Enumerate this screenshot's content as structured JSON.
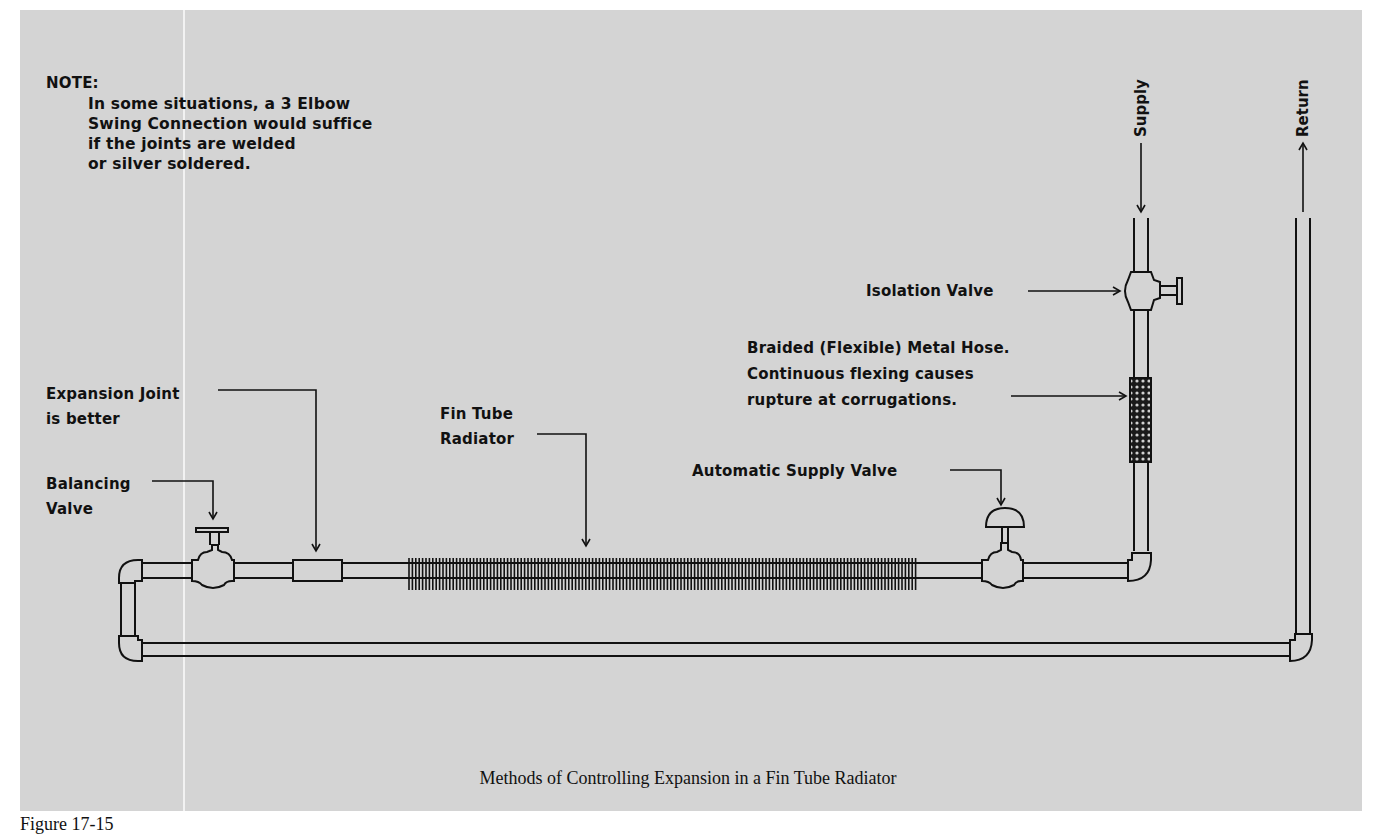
{
  "figure": {
    "caption": "Methods of Controlling Expansion in a Fin Tube Radiator",
    "figure_label": "Figure 17-15"
  },
  "note": {
    "title": "NOTE:",
    "lines": [
      "In some situations, a 3 Elbow",
      "Swing Connection would suffice",
      "if the joints are welded",
      "or silver soldered."
    ]
  },
  "labels": {
    "supply": "Supply",
    "return": "Return",
    "isolation_valve": "Isolation Valve",
    "braided_hose": [
      "Braided (Flexible) Metal Hose.",
      "Continuous flexing causes",
      "rupture at corrugations."
    ],
    "automatic_supply_valve": "Automatic Supply Valve",
    "fin_tube_radiator": [
      "Fin Tube",
      "Radiator"
    ],
    "expansion_joint": [
      "Expansion Joint",
      "is better"
    ],
    "balancing_valve": [
      "Balancing",
      "Valve"
    ]
  },
  "colors": {
    "background": "#d4d4d4",
    "line": "#111111"
  }
}
